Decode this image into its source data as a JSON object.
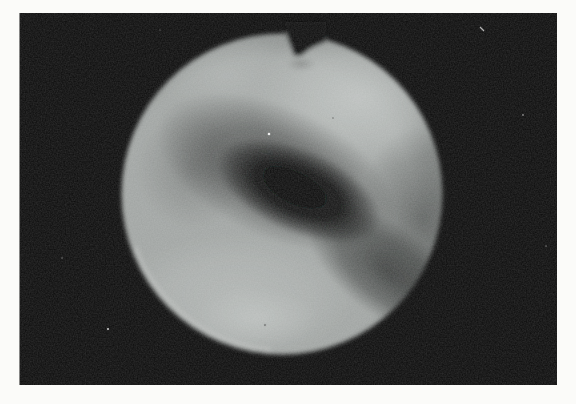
{
  "figure": {
    "type": "scanned-photograph",
    "page_background_color": "#fbfbf9",
    "photo_background_color": "#0b0b0b",
    "photo_frame": {
      "x": 19,
      "y": 13,
      "width": 538,
      "height": 372
    },
    "disc": {
      "center_x": 282,
      "center_y": 194,
      "radius": 160,
      "base_color": "#a0a4a2",
      "edge_color": "#7e8280",
      "highlight_top_right_color": "#bdc1bf",
      "highlight_top_left_color": "#aeb2b0",
      "highlight_bottom_left_color": "#b2b6b4",
      "highlight_bottom_center_color": "#c2c6c4",
      "shadow_halo_color": "#000000",
      "shadow_core_color": "#060606",
      "shadow_band_color": "#0b0d0c",
      "right_shade_color": "#101211",
      "rim_highlight_color": "#c8cac8",
      "notch": {
        "position": "top-center",
        "left_x": 286,
        "right_x": 326,
        "depth_px": 22
      }
    },
    "artifacts": {
      "white_speck_color": "#f2f2f2",
      "dark_fleck_color": "#000000",
      "white_speck_count": 7,
      "dark_fleck_count": 2,
      "grain": "fine scan grain across the photograph"
    }
  }
}
